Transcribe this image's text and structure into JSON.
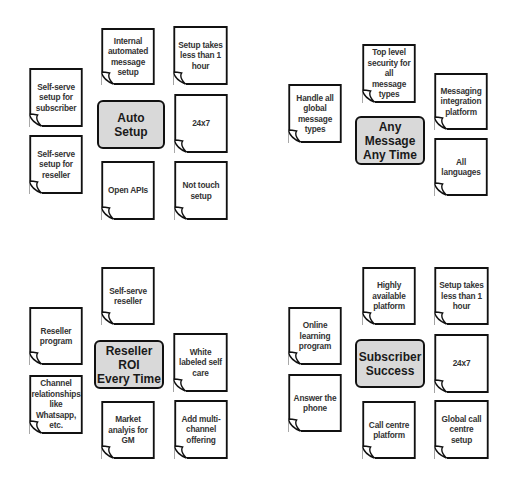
{
  "diagram": {
    "clusters": [
      {
        "id": "auto-setup",
        "hub": {
          "label": "Auto\nSetup",
          "x": 97,
          "y": 100,
          "w": 68,
          "w_h": 49
        },
        "notes": [
          {
            "label": "Internal automated message setup",
            "x": 99,
            "y": 28,
            "w": 58,
            "h": 57
          },
          {
            "label": "Setup takes less than 1 hour",
            "x": 171,
            "y": 26,
            "w": 59,
            "h": 59
          },
          {
            "label": "Self-serve setup for subscriber",
            "x": 27,
            "y": 68,
            "w": 58,
            "h": 59
          },
          {
            "label": "24x7",
            "x": 172,
            "y": 94,
            "w": 58,
            "h": 59
          },
          {
            "label": "Self-serve setup for reseller",
            "x": 27,
            "y": 135,
            "w": 58,
            "h": 59
          },
          {
            "label": "Open APIs",
            "x": 99,
            "y": 161,
            "w": 58,
            "h": 59
          },
          {
            "label": "Not touch setup",
            "x": 172,
            "y": 161,
            "w": 58,
            "h": 59
          }
        ]
      },
      {
        "id": "any-message-any-time",
        "hub": {
          "label": "Any Message\nAny Time",
          "x": 355,
          "y": 116,
          "w": 70,
          "w_h": 49
        },
        "notes": [
          {
            "label": "Top level security for all message types",
            "x": 360,
            "y": 44,
            "w": 58,
            "h": 59
          },
          {
            "label": "Messaging integration platform",
            "x": 432,
            "y": 73,
            "w": 58,
            "h": 57
          },
          {
            "label": "Handle all global message types",
            "x": 286,
            "y": 84,
            "w": 58,
            "h": 59
          },
          {
            "label": "All languages",
            "x": 432,
            "y": 138,
            "w": 58,
            "h": 58
          }
        ]
      },
      {
        "id": "reseller-roi",
        "hub": {
          "label": "Reseller ROI\nEvery Time",
          "x": 94,
          "y": 340,
          "w": 70,
          "w_h": 49
        },
        "notes": [
          {
            "label": "Self-serve reseller",
            "x": 99,
            "y": 267,
            "w": 58,
            "h": 58
          },
          {
            "label": "Reseller program",
            "x": 27,
            "y": 307,
            "w": 58,
            "h": 58
          },
          {
            "label": "White labeled self care",
            "x": 171,
            "y": 333,
            "w": 59,
            "h": 59
          },
          {
            "label": "Channel relationships like Whatsapp, etc.",
            "x": 27,
            "y": 375,
            "w": 58,
            "h": 59
          },
          {
            "label": "Market analyis for GM",
            "x": 99,
            "y": 401,
            "w": 58,
            "h": 58
          },
          {
            "label": "Add multi-channel offering",
            "x": 172,
            "y": 400,
            "w": 58,
            "h": 59
          }
        ]
      },
      {
        "id": "subscriber-success",
        "hub": {
          "label": "Subscriber\nSuccess",
          "x": 355,
          "y": 339,
          "w": 70,
          "w_h": 49
        },
        "notes": [
          {
            "label": "Highly available platform",
            "x": 360,
            "y": 267,
            "w": 58,
            "h": 58
          },
          {
            "label": "Setup takes less than 1 hour",
            "x": 432,
            "y": 267,
            "w": 59,
            "h": 58
          },
          {
            "label": "Online learning program",
            "x": 286,
            "y": 307,
            "w": 58,
            "h": 58
          },
          {
            "label": "24x7",
            "x": 432,
            "y": 334,
            "w": 59,
            "h": 59
          },
          {
            "label": "Answer the phone",
            "x": 286,
            "y": 374,
            "w": 58,
            "h": 58
          },
          {
            "label": "Call centre platform",
            "x": 360,
            "y": 401,
            "w": 58,
            "h": 58
          },
          {
            "label": "Global call centre setup",
            "x": 432,
            "y": 400,
            "w": 59,
            "h": 59
          }
        ]
      }
    ],
    "colors": {
      "hub_fill": "#d9d9d9",
      "note_fill": "#ffffff",
      "stroke": "#111111",
      "text": "#333333"
    }
  }
}
